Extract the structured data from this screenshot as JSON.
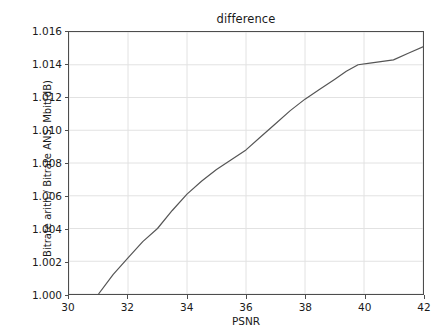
{
  "chart_data": {
    "type": "line",
    "title": "difference",
    "xlabel": "PSNR",
    "ylabel": "Bitrate arith / Bitrate ANS, Mbit(dB)",
    "xlim": [
      30,
      42
    ],
    "ylim": [
      1.0,
      1.016
    ],
    "grid": true,
    "legend": null,
    "xticks": [
      30,
      32,
      34,
      36,
      38,
      40,
      42
    ],
    "xtick_labels": [
      "30",
      "32",
      "34",
      "36",
      "38",
      "40",
      "42"
    ],
    "yticks": [
      1.0,
      1.002,
      1.004,
      1.006,
      1.008,
      1.01,
      1.012,
      1.014,
      1.016
    ],
    "ytick_labels": [
      "1.000",
      "1.002",
      "1.004",
      "1.006",
      "1.008",
      "1.010",
      "1.012",
      "1.014",
      "1.016"
    ],
    "line_color": "#555555",
    "line_width": 1.2,
    "series": [
      {
        "name": "difference",
        "x": [
          30.55,
          31.0,
          31.5,
          32.0,
          32.5,
          33.0,
          33.5,
          34.0,
          34.5,
          35.0,
          35.5,
          36.0,
          36.5,
          37.0,
          37.5,
          38.0,
          38.5,
          39.0,
          39.4,
          39.8,
          40.2,
          41.0,
          41.5,
          42.0
        ],
        "y": [
          0.999,
          1.0,
          1.0012,
          1.0022,
          1.0032,
          1.004,
          1.0051,
          1.0061,
          1.0069,
          1.0076,
          1.0082,
          1.0088,
          1.0096,
          1.0104,
          1.0112,
          1.0119,
          1.0125,
          1.0131,
          1.0136,
          1.014,
          1.0141,
          1.0143,
          1.0147,
          1.0151
        ]
      }
    ]
  },
  "axes": {
    "title": "difference",
    "xlabel": "PSNR",
    "ylabel": "Bitrate arith / Bitrate ANS, Mbit(dB)"
  },
  "colors": {
    "line": "#555555",
    "grid": "#e2e2e2",
    "axis": "#4d4d4d",
    "background": "#ffffff",
    "text": "#1a1a1a"
  }
}
